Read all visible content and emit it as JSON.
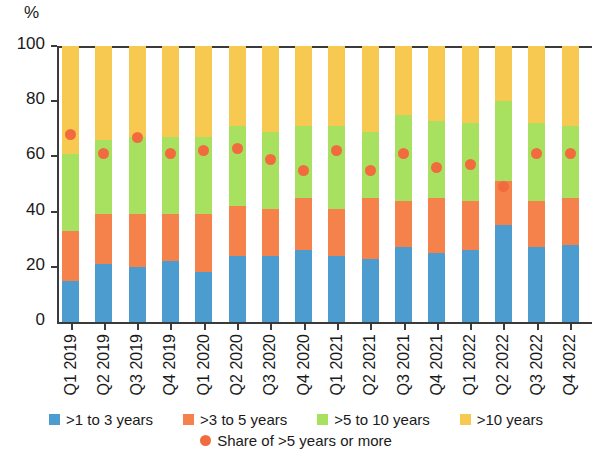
{
  "axis": {
    "unit_label": "%",
    "y_ticks": [
      0,
      20,
      40,
      60,
      80,
      100
    ],
    "y_min": 0,
    "y_max": 100
  },
  "legend": {
    "items": [
      {
        "label": ">1 to 3 years",
        "color": "#4D9CD0",
        "marker": "square"
      },
      {
        "label": ">3 to 5 years",
        "color": "#F5824A",
        "marker": "square"
      },
      {
        "label": ">5 to 10 years",
        "color": "#A8E060",
        "marker": "square"
      },
      {
        "label": ">10 years",
        "color": "#F8C950",
        "marker": "square"
      }
    ],
    "dot_item": {
      "label": "Share of >5 years or more",
      "color": "#F26B3E",
      "marker": "circle"
    }
  },
  "chart_data": {
    "type": "bar",
    "stacked": true,
    "title": "",
    "subtitle": "",
    "xlabel": "",
    "ylabel": "%",
    "ylim": [
      0,
      100
    ],
    "grid": false,
    "legend_position": "bottom",
    "categories": [
      "Q1 2019",
      "Q2 2019",
      "Q3 2019",
      "Q4 2019",
      "Q1 2020",
      "Q2 2020",
      "Q3 2020",
      "Q4 2020",
      "Q1 2021",
      "Q2 2021",
      "Q3 2021",
      "Q4 2021",
      "Q1 2022",
      "Q2 2022",
      "Q3 2022",
      "Q4 2022"
    ],
    "series": [
      {
        "name": ">1 to 3 years",
        "color": "#4D9CD0",
        "values": [
          15,
          21,
          20,
          22,
          18,
          24,
          24,
          26,
          24,
          23,
          27,
          25,
          26,
          35,
          27,
          28
        ]
      },
      {
        "name": ">3 to 5 years",
        "color": "#F5824A",
        "values": [
          18,
          18,
          19,
          17,
          21,
          18,
          17,
          19,
          17,
          22,
          17,
          20,
          18,
          16,
          17,
          17
        ]
      },
      {
        "name": ">5 to 10 years",
        "color": "#A8E060",
        "values": [
          28,
          27,
          28,
          28,
          28,
          29,
          28,
          26,
          30,
          24,
          31,
          28,
          28,
          29,
          28,
          26
        ]
      },
      {
        "name": ">10 years",
        "color": "#F8C950",
        "values": [
          39,
          34,
          33,
          33,
          33,
          29,
          31,
          29,
          29,
          31,
          25,
          27,
          28,
          20,
          28,
          29
        ]
      }
    ],
    "overlay_series": {
      "name": "Share of >5 years or more",
      "type": "scatter",
      "color": "#F26B3E",
      "values": [
        68,
        61,
        67,
        61,
        62,
        63,
        59,
        55,
        62,
        55,
        61,
        56,
        57,
        49,
        61,
        61
      ]
    }
  }
}
